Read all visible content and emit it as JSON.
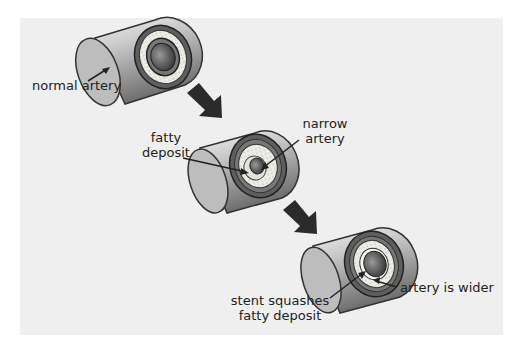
{
  "diagram": {
    "stages": [
      {
        "id": "normal",
        "labels": [
          "normal artery"
        ]
      },
      {
        "id": "narrowed",
        "labels": [
          "fatty deposit",
          "narrow artery"
        ]
      },
      {
        "id": "stented",
        "labels": [
          "stent squashes fatty deposit",
          "artery is wider"
        ]
      }
    ],
    "labels": {
      "normal_artery": "normal artery",
      "fatty_line1": "fatty",
      "fatty_line2": "deposit",
      "narrow_line1": "narrow",
      "narrow_line2": "artery",
      "stent_line1": "stent squashes",
      "stent_line2": "fatty deposit",
      "wider": "artery is wider"
    },
    "colors": {
      "panel": "#efefef",
      "arrow": "#2b2b2b",
      "tube_light": "#d9d9d9",
      "tube_dark": "#6e6e6e",
      "wall": "#555555",
      "fat": "#e8e6e0"
    }
  }
}
